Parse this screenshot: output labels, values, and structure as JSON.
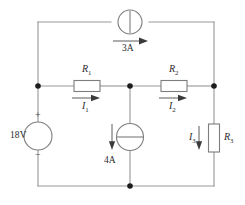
{
  "diagram": {
    "type": "electrical-schematic",
    "background_color": "#ffffff",
    "wire_color": "#9a9a9a",
    "component_color": "#7d7d7d",
    "node_color": "#1c1c1c"
  },
  "sources": {
    "voltage": {
      "label": "18V",
      "plus_sign": "+",
      "minus_sign": "−",
      "symbol": "voltage-source-circle",
      "position": "left-branch"
    },
    "current_top": {
      "label": "3A",
      "symbol": "current-source-circle-vertical-bar",
      "direction": "right",
      "position": "top-rail"
    },
    "current_middle": {
      "label": "4A",
      "symbol": "current-source-circle-horizontal-bar",
      "direction": "down",
      "position": "middle-branch"
    }
  },
  "resistors": [
    {
      "name": "R1",
      "label": "R",
      "subscript": "1",
      "orientation": "horizontal",
      "current_label": "I",
      "current_subscript": "1",
      "current_direction": "right"
    },
    {
      "name": "R2",
      "label": "R",
      "subscript": "2",
      "orientation": "horizontal",
      "current_label": "I",
      "current_subscript": "2",
      "current_direction": "right"
    },
    {
      "name": "R3",
      "label": "R",
      "subscript": "3",
      "orientation": "vertical",
      "current_label": "I",
      "current_subscript": "3",
      "current_direction": "down"
    }
  ],
  "nodes": [
    {
      "name": "node-left-middle",
      "x": 38,
      "y": 86
    },
    {
      "name": "node-center-middle",
      "x": 130,
      "y": 86
    },
    {
      "name": "node-right-middle",
      "x": 214,
      "y": 86
    },
    {
      "name": "node-center-bottom",
      "x": 130,
      "y": 186
    }
  ]
}
